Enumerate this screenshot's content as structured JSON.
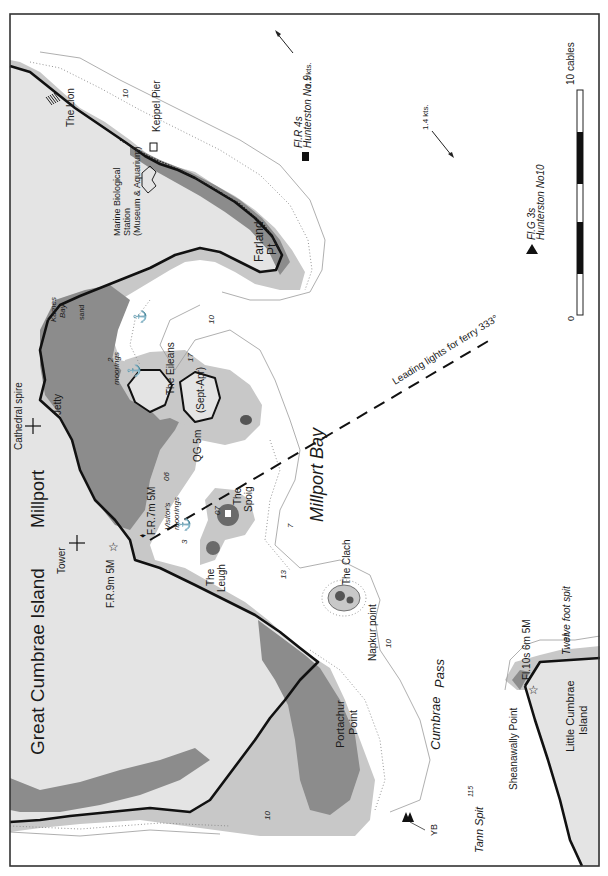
{
  "map": {
    "title": "Millport Bay",
    "orientation": "rotated 90° counter-clockwise (north to the left)",
    "islands": {
      "great": "Great Cumbrae Island",
      "little_line1": "Little Cumbrae",
      "little_line2": "Island"
    },
    "places": {
      "millport": "Millport",
      "millport_bay": "Millport Bay",
      "cumbrae": "Cumbrae",
      "pass": "Pass",
      "tann_spit": "Tann Spit",
      "the_lion": "The Lion",
      "keppel_pier": "Keppel Pier",
      "marine_station_1": "Marine Biological",
      "marine_station_2": "Station",
      "marine_station_3": "(Museum & Aquarium)",
      "farland_1": "Farland",
      "farland_2": "Pt.",
      "kames_1": "Kames",
      "kames_2": "Bay",
      "sand": "sand",
      "jetty": "Jetty",
      "cathedral": "Cathedral spire",
      "tower": "Tower",
      "the_eileans": "The Eileans",
      "sept_apr": "(Sept-Apr)",
      "moorings": "moorings",
      "visitors_1": "Visitor's",
      "visitors_2": "moorings",
      "the_spoig_1": "The",
      "the_spoig_2": "Spoig",
      "the_leugh_1": "The",
      "the_leugh_2": "Leugh",
      "the_clach": "The Clach",
      "napkur": "Napkur point",
      "portachur_1": "Portachur",
      "portachur_2": "Point",
      "sheanawally": "Sheanawally Point",
      "twelve_foot": "Twelve foot spit"
    },
    "lights": {
      "fr9": "F.R.9m 5M",
      "fr7": "F.R.7m 5M",
      "qg5": "QG 5m",
      "fl10": "Fl.10s 6m 5M",
      "buoy9_char": "Fl.R 4s",
      "buoy9_name": "Hunterston No.9",
      "buoy10_char": "Fl.G 3s",
      "buoy10_name": "Hunterston No10",
      "yb": "YB"
    },
    "leading_line": "Leading lights for ferry 333°",
    "tidal": {
      "stream1": "1.1 kts.",
      "stream2": "1.4 kts."
    },
    "soundings": {
      "s10a": "10",
      "s10b": "10",
      "s10c": "10",
      "s10d": "10",
      "s2": "2",
      "s17": "17",
      "s06": "06",
      "s07": "07",
      "s3": "3",
      "s7": "7",
      "s13": "13",
      "s115": "115",
      "s31": "31"
    },
    "scale": {
      "label": "10 cables",
      "zero": "0"
    },
    "colors": {
      "land": "#e4e4e4",
      "drying": "#8c8c8c",
      "shallow": "#c8c8c8",
      "water": "#ffffff",
      "coast": "#111111"
    }
  }
}
